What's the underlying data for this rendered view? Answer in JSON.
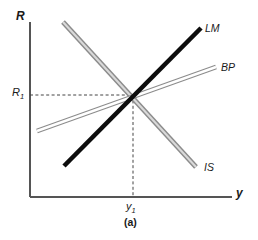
{
  "figure": {
    "caption": "(a)",
    "axes": {
      "y_axis_label": "R",
      "x_axis_label": "y",
      "origin": {
        "x": 30,
        "y": 197
      },
      "x_axis_end": {
        "x": 232,
        "y": 197
      },
      "y_axis_top": {
        "x": 30,
        "y": 22
      },
      "axis_color": "#555555"
    },
    "ticks": {
      "rate_tick_label": "R",
      "rate_tick_sub": "1",
      "income_tick_label": "y",
      "income_tick_sub": "1"
    },
    "equilibrium": {
      "x": 133,
      "y": 95,
      "guide_color": "#444444",
      "guide_style": "dashed"
    },
    "curves": [
      {
        "name": "LM",
        "label": "LM",
        "style": "solid-thick-black",
        "color": "#0d0d0d",
        "width": 4.6,
        "x1": 64,
        "y1": 166,
        "x2": 201,
        "y2": 28
      },
      {
        "name": "BP",
        "label": "BP",
        "style": "hollow-outline-gray",
        "color": "#8a8a8a",
        "width": 4.2,
        "x1": 37,
        "y1": 131,
        "x2": 216,
        "y2": 67
      },
      {
        "name": "IS",
        "label": "IS",
        "style": "solid-thick-gray",
        "color": "#a0a0a0",
        "width": 4.6,
        "x1": 63,
        "y1": 22,
        "x2": 196,
        "y2": 167
      }
    ]
  },
  "chart_data": {
    "type": "line",
    "title": "(a)",
    "xlabel": "y",
    "ylabel": "R",
    "grid": false,
    "legend": "inline-end-labels",
    "xlim": [
      0,
      1
    ],
    "ylim": [
      0,
      1
    ],
    "annotations": [
      {
        "text": "R1",
        "type": "axis-tick",
        "axis": "y"
      },
      {
        "text": "y1",
        "type": "axis-tick",
        "axis": "x"
      }
    ],
    "series": [
      {
        "name": "LM",
        "slope": "positive-steep",
        "points": [
          {
            "x": 64,
            "y": 166
          },
          {
            "x": 201,
            "y": 28
          }
        ]
      },
      {
        "name": "BP",
        "slope": "positive-shallow",
        "points": [
          {
            "x": 37,
            "y": 131
          },
          {
            "x": 216,
            "y": 67
          }
        ]
      },
      {
        "name": "IS",
        "slope": "negative",
        "points": [
          {
            "x": 63,
            "y": 22
          },
          {
            "x": 196,
            "y": 167
          }
        ]
      }
    ],
    "intersection": {
      "label": "equilibrium",
      "x": 133,
      "y": 95
    }
  }
}
